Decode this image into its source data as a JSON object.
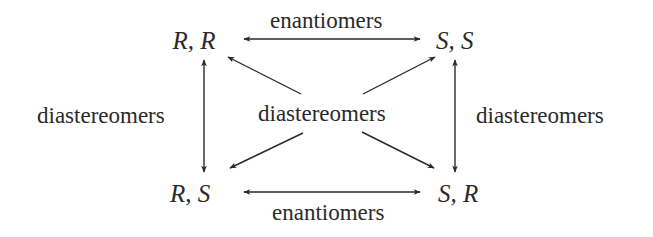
{
  "diagram": {
    "type": "stereoisomer-relationship-diagram",
    "colors": {
      "background": "#ffffff",
      "ink": "#2a2a2a"
    },
    "nodes": {
      "top_left": "R, R",
      "top_right": "S, S",
      "bottom_left": "R, S",
      "bottom_right": "S, R"
    },
    "labels": {
      "top": "enantiomers",
      "bottom": "enantiomers",
      "left": "diastereomers",
      "right": "diastereomers",
      "center": "diastereomers"
    },
    "edges": [
      {
        "from": "R, R",
        "to": "S, S",
        "relation": "enantiomers",
        "direction": "bidirectional"
      },
      {
        "from": "R, S",
        "to": "S, R",
        "relation": "enantiomers",
        "direction": "bidirectional"
      },
      {
        "from": "R, R",
        "to": "R, S",
        "relation": "diastereomers",
        "direction": "bidirectional"
      },
      {
        "from": "S, S",
        "to": "S, R",
        "relation": "diastereomers",
        "direction": "bidirectional"
      },
      {
        "from": "center",
        "to": "R, R",
        "relation": "diastereomers",
        "direction": "outward"
      },
      {
        "from": "center",
        "to": "S, S",
        "relation": "diastereomers",
        "direction": "outward"
      },
      {
        "from": "center",
        "to": "R, S",
        "relation": "diastereomers",
        "direction": "outward"
      },
      {
        "from": "center",
        "to": "S, R",
        "relation": "diastereomers",
        "direction": "outward"
      }
    ]
  }
}
